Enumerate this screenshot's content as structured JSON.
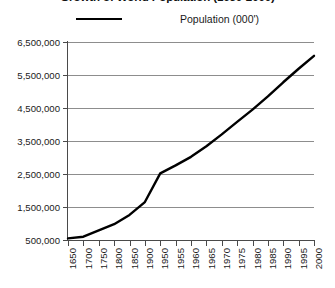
{
  "chart": {
    "title": "Growth of World Population (1650-2000)",
    "legend": {
      "position": "top-center",
      "entries": [
        {
          "label": "Population (000')",
          "color": "#000000",
          "marker": "line-swatch"
        }
      ]
    }
  },
  "chart_data": {
    "type": "line",
    "title": "Growth of World Population (1650-2000)",
    "xlabel": "",
    "ylabel": "",
    "grid": true,
    "legend_position": "top-center",
    "ylim": [
      500000,
      6500000
    ],
    "ytick_step": 1000000,
    "ytick_labels": [
      "500,000",
      "1,500,000",
      "2,500,000",
      "3,500,000",
      "4,500,000",
      "5,500,000",
      "6,500,000"
    ],
    "ytick_values": [
      500000,
      1500000,
      2500000,
      3500000,
      4500000,
      5500000,
      6500000
    ],
    "categories": [
      "1650",
      "1700",
      "1750",
      "1800",
      "1850",
      "1900",
      "1950",
      "1955",
      "1960",
      "1965",
      "1970",
      "1975",
      "1980",
      "1985",
      "1990",
      "1995",
      "2000"
    ],
    "series": [
      {
        "name": "Population (000')",
        "color": "#000000",
        "values": [
          550000,
          600000,
          790000,
          980000,
          1260000,
          1650000,
          2520000,
          2760000,
          3020000,
          3340000,
          3700000,
          4080000,
          4450000,
          4850000,
          5280000,
          5690000,
          6080000
        ]
      }
    ]
  },
  "colors": {
    "series": "#000000",
    "gridline": "#8d8d8d",
    "axis": "#4a4a4a",
    "background": "#ffffff",
    "text": "#1a1a1a"
  }
}
